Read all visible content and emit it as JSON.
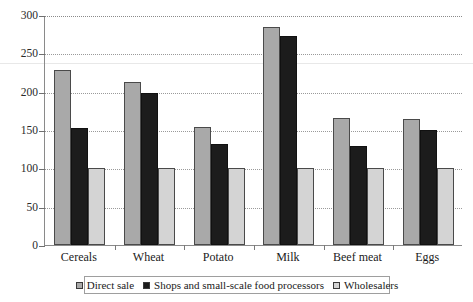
{
  "chart_data": {
    "type": "bar",
    "title": "",
    "subtitle": "",
    "xlabel": "",
    "ylabel": "",
    "ylim": [
      0,
      300
    ],
    "yticks": [
      0,
      50,
      100,
      150,
      200,
      250,
      300
    ],
    "ytick_labels": [
      "0",
      "50",
      "100",
      "150",
      "200",
      "250",
      "300"
    ],
    "grid": true,
    "grid_style": "dotted-horizontal",
    "legend_position": "bottom-center",
    "categories": [
      "Cereals",
      "Wheat",
      "Potato",
      "Milk",
      "Beef meat",
      "Eggs"
    ],
    "series": [
      {
        "name": "Direct sale",
        "color": "#a9a9a9",
        "values": [
          228,
          213,
          154,
          285,
          166,
          164
        ]
      },
      {
        "name": "Shops and small-scale food processors",
        "color": "#1c1c1c",
        "values": [
          153,
          198,
          132,
          273,
          129,
          150
        ]
      },
      {
        "name": "Wholesalers",
        "color": "#d4d4d4",
        "values": [
          101,
          101,
          101,
          101,
          101,
          101
        ]
      }
    ]
  },
  "axis": {
    "y_max_label": "300",
    "y_min_label": "0"
  },
  "colors": {
    "series_direct_sale": "#a9a9a9",
    "series_shops": "#1c1c1c",
    "series_wholesalers": "#d4d4d4",
    "axis_line": "#8a8a8a",
    "grid_line": "#9a9a9a",
    "legend_border": "#9e9e9e",
    "background": "#ffffff"
  }
}
